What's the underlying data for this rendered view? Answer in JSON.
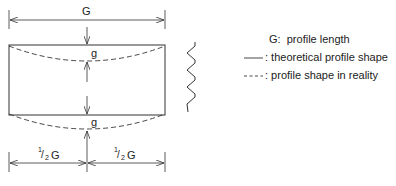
{
  "diagram": {
    "dimension_labels": {
      "overall_length": "G",
      "gap_top": "g",
      "gap_bottom": "g",
      "half_left_num": "1",
      "half_left_den": "2",
      "half_left_var": "G",
      "half_right_num": "1",
      "half_right_den": "2",
      "half_right_var": "G"
    },
    "legend": {
      "items": [
        {
          "symbol": "G:",
          "text": "profile length"
        },
        {
          "symbol": "solid-line",
          "text": ": theoretical profile shape"
        },
        {
          "symbol": "dashed-line",
          "text": ": profile shape in reality"
        }
      ]
    },
    "colors": {
      "stroke": "#333333",
      "text": "#222222"
    }
  }
}
